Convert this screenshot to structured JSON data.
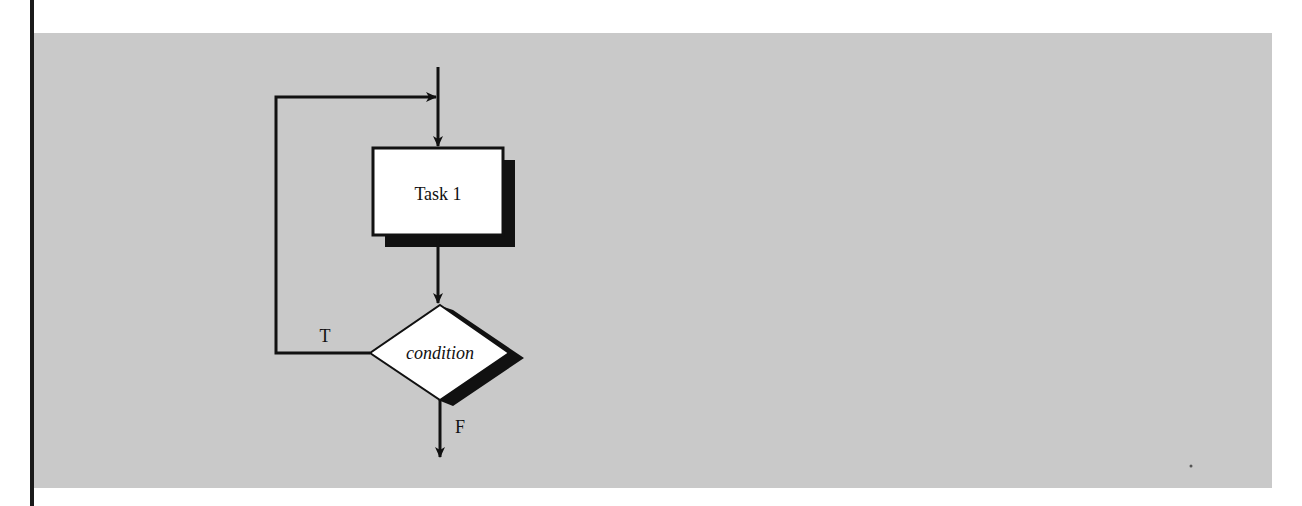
{
  "diagram": {
    "type": "flowchart",
    "nodes": [
      {
        "id": "task1",
        "shape": "rectangle",
        "label": "Task 1"
      },
      {
        "id": "cond",
        "shape": "diamond",
        "label": "condition"
      }
    ],
    "edges": [
      {
        "from": "entry",
        "to": "task1",
        "label": ""
      },
      {
        "from": "task1",
        "to": "cond",
        "label": ""
      },
      {
        "from": "cond",
        "to": "task1",
        "label": "T"
      },
      {
        "from": "cond",
        "to": "exit",
        "label": "F"
      }
    ],
    "labels": {
      "task": "Task 1",
      "condition": "condition",
      "true_branch": "T",
      "false_branch": "F"
    },
    "colors": {
      "panel": "#c9c9c9",
      "node_fill": "#ffffff",
      "stroke": "#111111",
      "shadow": "#111111"
    }
  }
}
